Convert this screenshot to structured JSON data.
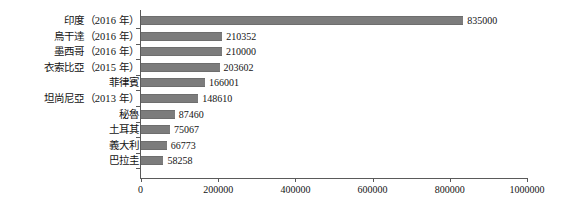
{
  "chart_data": {
    "type": "bar",
    "orientation": "horizontal",
    "title": "",
    "subtitle": "",
    "xlabel": "",
    "ylabel": "",
    "xlim": [
      0,
      1000000
    ],
    "grid": false,
    "legend": false,
    "legend_position": "none",
    "bar_color": "#7c7c7c",
    "axis_color": "#5a5a5a",
    "background_color": "#ffffff",
    "xticks": [
      0,
      200000,
      400000,
      600000,
      800000,
      1000000
    ],
    "xtick_labels": [
      "0",
      "200000",
      "400000",
      "600000",
      "800000",
      "1000000"
    ],
    "categories": [
      "印度（2016 年）",
      "烏干達（2016 年）",
      "墨西哥（2016 年）",
      "衣索比亞（2015 年）",
      "菲律賓",
      "坦尚尼亞（2013 年）",
      "秘魯",
      "土耳其",
      "義大利",
      "巴拉圭"
    ],
    "values": [
      835000,
      210352,
      210000,
      203602,
      166001,
      148610,
      87460,
      75067,
      66773,
      58258
    ],
    "data_labels": [
      "835000",
      "210352",
      "210000",
      "203602",
      "166001",
      "148610",
      "87460",
      "75067",
      "66773",
      "58258"
    ]
  }
}
